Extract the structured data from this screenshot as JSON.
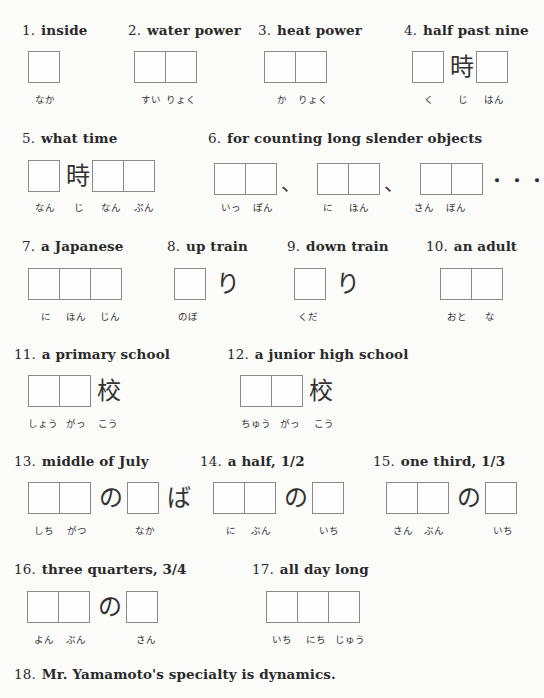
{
  "items": [
    {
      "n": "1.",
      "label": "inside",
      "readings": [
        "なか"
      ]
    },
    {
      "n": "2.",
      "label": "water power",
      "readings": [
        "すい",
        "りょく"
      ]
    },
    {
      "n": "3.",
      "label": "heat power",
      "readings": [
        "か",
        "りょく"
      ]
    },
    {
      "n": "4.",
      "label": "half past nine",
      "mid": "時",
      "readings": [
        "く",
        "じ",
        "はん"
      ]
    },
    {
      "n": "5.",
      "label": "what time",
      "mid": "時",
      "readings": [
        "なん",
        "じ",
        "なん",
        "ぷん"
      ]
    },
    {
      "n": "6.",
      "label": "for counting long slender objects",
      "sep": "、",
      "ellipsis": "・・・",
      "readings": [
        "いっ",
        "ぽん",
        "に",
        "ほん",
        "さん",
        "ぼん"
      ]
    },
    {
      "n": "7.",
      "label": "a Japanese",
      "readings": [
        "に",
        "ほん",
        "じん"
      ]
    },
    {
      "n": "8.",
      "label": "up train",
      "suffix": "り",
      "readings": [
        "のぼ"
      ]
    },
    {
      "n": "9.",
      "label": "down train",
      "suffix": "り",
      "readings": [
        "くだ"
      ]
    },
    {
      "n": "10.",
      "label": "an adult",
      "readings": [
        "おと",
        "な"
      ]
    },
    {
      "n": "11.",
      "label": "a primary school",
      "suffix": "校",
      "readings": [
        "しょう",
        "がっ",
        "こう"
      ]
    },
    {
      "n": "12.",
      "label": "a junior high school",
      "suffix": "校",
      "readings": [
        "ちゅう",
        "がっ",
        "こう"
      ]
    },
    {
      "n": "13.",
      "label": "middle of July",
      "mid": "の",
      "suffix": "ば",
      "readings": [
        "しち",
        "がつ",
        "なか"
      ]
    },
    {
      "n": "14.",
      "label": "a half, 1/2",
      "mid": "の",
      "readings": [
        "に",
        "ぶん",
        "いち"
      ]
    },
    {
      "n": "15.",
      "label": "one third, 1/3",
      "mid": "の",
      "readings": [
        "さん",
        "ぶん",
        "いち"
      ]
    },
    {
      "n": "16.",
      "label": "three quarters, 3/4",
      "mid": "の",
      "readings": [
        "よん",
        "ぶん",
        "さん"
      ]
    },
    {
      "n": "17.",
      "label": "all day long",
      "readings": [
        "いち",
        "にち",
        "じゅう"
      ]
    },
    {
      "n": "18.",
      "label": "Mr. Yamamoto's specialty is dynamics."
    }
  ]
}
